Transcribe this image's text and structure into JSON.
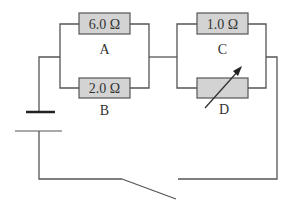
{
  "diagram": {
    "type": "circuit",
    "resistors": [
      {
        "id": "A",
        "label": "A",
        "value": "6.0 Ω"
      },
      {
        "id": "B",
        "label": "B",
        "value": "2.0 Ω"
      },
      {
        "id": "C",
        "label": "C",
        "value": "1.0 Ω"
      },
      {
        "id": "D",
        "label": "D",
        "value": "",
        "variable": true
      }
    ],
    "components": [
      "battery",
      "switch (open)"
    ],
    "colors": {
      "wire": "#555555",
      "resistor_fill": "#d3d3d3"
    }
  }
}
